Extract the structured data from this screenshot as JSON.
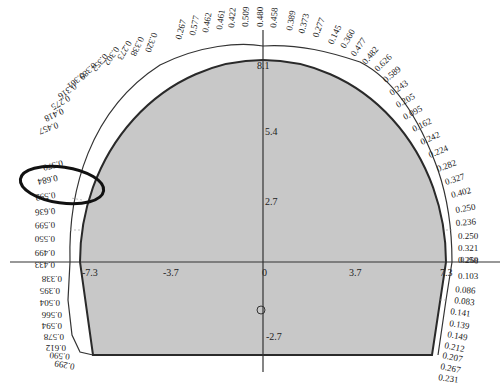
{
  "diagram": {
    "type": "tunnel-cross-section",
    "colors": {
      "fill": "#c8c8c8",
      "outline": "#2a2a2a",
      "axis": "#333333",
      "text": "#222222",
      "highlight_ellipse": "#111111"
    },
    "axes": {
      "x_ticks": [
        {
          "label": "-7.3",
          "value": -7.3
        },
        {
          "label": "-3.7",
          "value": -3.7
        },
        {
          "label": "0",
          "value": 0
        },
        {
          "label": "3.7",
          "value": 3.7
        },
        {
          "label": "7.3",
          "value": 7.3
        }
      ],
      "y_ticks": [
        {
          "label": "8.1",
          "value": 8.1
        },
        {
          "label": "5.4",
          "value": 5.4
        },
        {
          "label": "2.7",
          "value": 2.7
        },
        {
          "label": "-2.7",
          "value": -2.7
        }
      ]
    },
    "top_values": [
      "0.267",
      "0.577",
      "0.462",
      "0.461",
      "0.422",
      "0.509",
      "0.480",
      "0.458",
      "0.389",
      "0.373",
      "0.277",
      "0.145",
      "0.360",
      "0.477",
      "0.482",
      "0.626"
    ],
    "upper_left_values": [
      "0.320",
      "0.338",
      "0.273",
      "0.302",
      "0.352",
      "0.389",
      "0.361",
      "0.316",
      "0.275",
      "0.418",
      "0.457",
      "0.570",
      "0.684",
      "0.592",
      "0.636"
    ],
    "left_values": [
      "0.599",
      "0.550",
      "0.499",
      "0.433",
      "0.338",
      "0.395",
      "0.504",
      "0.566",
      "0.594",
      "0.578",
      "0.612",
      "0.590",
      "0.299"
    ],
    "right_values": [
      "0.589",
      "0.243",
      "0.205",
      "0.095",
      "0.162",
      "0.242",
      "0.224",
      "0.282",
      "0.327",
      "0.402",
      "0.250",
      "0.236",
      "0.250",
      "0.321",
      "0.250",
      "0.268",
      "0.103",
      "0.086",
      "0.083",
      "0.141",
      "0.139",
      "0.149",
      "0.212",
      "0.207",
      "0.267",
      "0.231"
    ],
    "highlighted_values": [
      "0.570",
      "0.684",
      "0.592"
    ]
  }
}
